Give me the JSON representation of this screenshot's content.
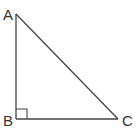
{
  "diagram": {
    "type": "right-triangle",
    "stroke_color": "#444444",
    "label_color": "#333333",
    "vertices": [
      {
        "label": "A",
        "x": 16,
        "y": 14
      },
      {
        "label": "B",
        "x": 16,
        "y": 119
      },
      {
        "label": "C",
        "x": 118,
        "y": 119
      }
    ],
    "right_angle_at": "B",
    "labels": {
      "a": "A",
      "b": "B",
      "c": "C"
    }
  }
}
